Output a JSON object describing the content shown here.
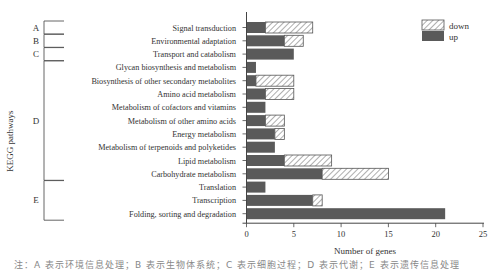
{
  "chart_data": {
    "type": "bar",
    "orientation": "horizontal",
    "stacked": true,
    "title": "",
    "xlabel": "Number of genes",
    "ylabel": "KEGG pathways",
    "xlim": [
      0,
      25
    ],
    "xticks": [
      0,
      5,
      10,
      15,
      20,
      25
    ],
    "grid": false,
    "legend_position": "top-right",
    "categories": [
      "Signal transduction",
      "Environmental adaptation",
      "Transport and catabolism",
      "Glycan biosynthesis and metabolism",
      "Biosynthesis of other secondary metabolites",
      "Amino acid metabolism",
      "Metabolism of cofactors and vitamins",
      "Metabolism of other amino acids",
      "Energy metabolism",
      "Metabolism of terpenoids and polyketides",
      "Lipid metabolism",
      "Carbohydrate metabolism",
      "Translation",
      "Transcription",
      "Folding, sorting and degradation"
    ],
    "series": [
      {
        "name": "up",
        "style": "solid",
        "color": "#5a5a5a",
        "values": [
          2,
          4,
          5,
          1,
          1,
          2,
          2,
          2,
          3,
          3,
          4,
          8,
          2,
          7,
          21
        ]
      },
      {
        "name": "down",
        "style": "hatched",
        "color": "#ffffff",
        "values": [
          5,
          2,
          0,
          0,
          4,
          3,
          0,
          2,
          1,
          0,
          5,
          7,
          0,
          1,
          0
        ]
      }
    ],
    "groups": [
      {
        "label": "A",
        "start": 0,
        "end": 0
      },
      {
        "label": "B",
        "start": 1,
        "end": 1
      },
      {
        "label": "C",
        "start": 2,
        "end": 2
      },
      {
        "label": "D",
        "start": 3,
        "end": 11
      },
      {
        "label": "E",
        "start": 12,
        "end": 14
      }
    ]
  },
  "legend": {
    "down": "down",
    "up": "up"
  },
  "caption": "注：A 表示环境信息处理；B 表示生物体系统；C 表示细胞过程；D 表示代谢；E 表示遗传信息处理"
}
